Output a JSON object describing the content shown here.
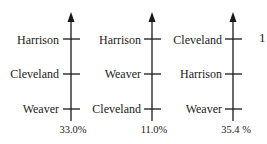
{
  "diagram": {
    "type": "preference-rankings",
    "panels": [
      {
        "ranking": [
          "Harrison",
          "Cleveland",
          "Weaver"
        ],
        "percent": "33.0%"
      },
      {
        "ranking": [
          "Harrison",
          "Weaver",
          "Cleveland"
        ],
        "percent": "11.0%"
      },
      {
        "ranking": [
          "Cleveland",
          "Harrison",
          "Weaver"
        ],
        "percent": "35.4 %"
      }
    ],
    "trailing_label": "1"
  },
  "colors": {
    "ink": "#1a1a1a",
    "background": "#ffffff"
  }
}
